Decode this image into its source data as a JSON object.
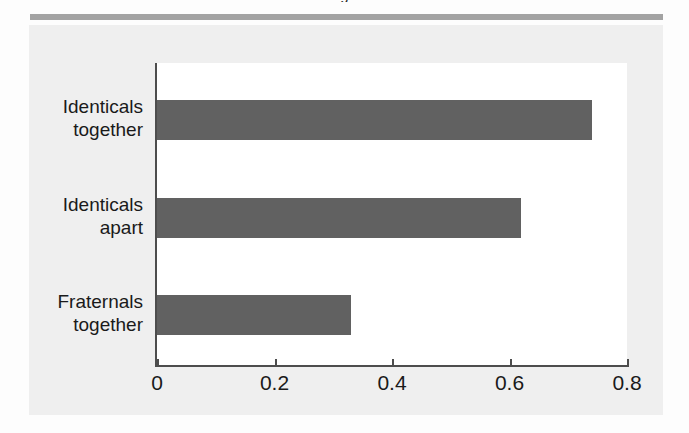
{
  "figure": {
    "clipped_heading_text": "g",
    "panel_background": "#efefef",
    "rule_color": "#a3a3a3",
    "bar_color": "#616161",
    "axis_color": "#4d4d4d"
  },
  "chart_data": {
    "type": "bar",
    "orientation": "horizontal",
    "title": "",
    "xlabel": "",
    "ylabel": "",
    "categories": [
      "Identicals together",
      "Identicals apart",
      "Fraternals together"
    ],
    "category_lines": [
      [
        "Identicals",
        "together"
      ],
      [
        "Identicals",
        "apart"
      ],
      [
        "Fraternals",
        "together"
      ]
    ],
    "values": [
      0.74,
      0.62,
      0.33
    ],
    "xlim": [
      0,
      0.8
    ],
    "xticks": [
      0,
      0.2,
      0.4,
      0.6,
      0.8
    ],
    "xticklabels": [
      "0",
      "0.2",
      "0.4",
      "0.6",
      "0.8"
    ],
    "grid": false,
    "legend": false
  }
}
